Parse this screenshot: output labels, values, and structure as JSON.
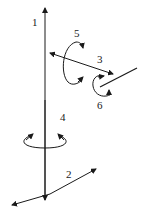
{
  "diagram": {
    "labels": {
      "axis1": "1",
      "axis2": "2",
      "axis3": "3",
      "rot4": "4",
      "rot5": "5",
      "rot6": "6"
    },
    "colors": {
      "stroke": "#1a1a1a",
      "background": "#ffffff"
    }
  }
}
